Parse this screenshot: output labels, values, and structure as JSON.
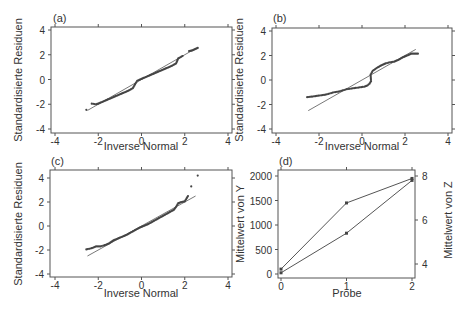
{
  "chart_data": [
    {
      "type": "scatter",
      "panel_label": "(a)",
      "xlabel": "Inverse Normal",
      "ylabel": "Standardisierte Residuen",
      "xlim": [
        -4,
        4
      ],
      "ylim": [
        -4,
        4
      ],
      "xticks": [
        -4,
        -2,
        0,
        2,
        4
      ],
      "yticks": [
        -4,
        -2,
        0,
        2,
        4
      ],
      "grid": false,
      "reference_line": {
        "x": [
          -2.5,
          2.5
        ],
        "y": [
          -2.5,
          2.5
        ]
      },
      "series": [
        {
          "name": "Residuen",
          "points": [
            [
              -2.55,
              -2.45
            ],
            [
              -2.3,
              -1.95
            ],
            [
              -2.1,
              -2.0
            ],
            [
              -2.0,
              -1.95
            ],
            [
              -1.8,
              -1.8
            ],
            [
              -1.6,
              -1.65
            ],
            [
              -1.4,
              -1.5
            ],
            [
              -1.2,
              -1.35
            ],
            [
              -1.0,
              -1.2
            ],
            [
              -0.8,
              -1.05
            ],
            [
              -0.6,
              -0.9
            ],
            [
              -0.4,
              -0.7
            ],
            [
              -0.3,
              -0.4
            ],
            [
              -0.2,
              -0.1
            ],
            [
              0.0,
              0.05
            ],
            [
              0.2,
              0.2
            ],
            [
              0.4,
              0.35
            ],
            [
              0.6,
              0.5
            ],
            [
              0.8,
              0.65
            ],
            [
              1.0,
              0.8
            ],
            [
              1.2,
              0.95
            ],
            [
              1.4,
              1.1
            ],
            [
              1.6,
              1.3
            ],
            [
              1.7,
              1.7
            ],
            [
              1.9,
              1.9
            ],
            [
              2.2,
              2.3
            ],
            [
              2.35,
              2.35
            ],
            [
              2.6,
              2.55
            ]
          ]
        }
      ]
    },
    {
      "type": "scatter",
      "panel_label": "(b)",
      "xlabel": "Inverse Normal",
      "ylabel": "Standardisierte Residuen",
      "xlim": [
        -4,
        4
      ],
      "ylim": [
        -4,
        4
      ],
      "xticks": [
        -4,
        -2,
        0,
        2,
        4
      ],
      "yticks": [
        -4,
        -2,
        0,
        2,
        4
      ],
      "grid": false,
      "reference_line": {
        "x": [
          -2.5,
          2.5
        ],
        "y": [
          -2.5,
          2.5
        ]
      },
      "series": [
        {
          "name": "Residuen",
          "points": [
            [
              -2.55,
              -1.4
            ],
            [
              -2.3,
              -1.35
            ],
            [
              -2.1,
              -1.3
            ],
            [
              -1.9,
              -1.25
            ],
            [
              -1.7,
              -1.2
            ],
            [
              -1.5,
              -1.1
            ],
            [
              -1.3,
              -1.0
            ],
            [
              -1.1,
              -0.95
            ],
            [
              -0.9,
              -0.85
            ],
            [
              -0.7,
              -0.75
            ],
            [
              -0.5,
              -0.7
            ],
            [
              -0.3,
              -0.65
            ],
            [
              -0.1,
              -0.6
            ],
            [
              0.1,
              -0.55
            ],
            [
              0.25,
              -0.45
            ],
            [
              0.35,
              -0.3
            ],
            [
              0.42,
              -0.1
            ],
            [
              0.4,
              0.45
            ],
            [
              0.5,
              0.75
            ],
            [
              0.7,
              1.0
            ],
            [
              0.9,
              1.2
            ],
            [
              1.1,
              1.35
            ],
            [
              1.3,
              1.45
            ],
            [
              1.5,
              1.5
            ],
            [
              1.7,
              1.65
            ],
            [
              1.9,
              1.85
            ],
            [
              2.1,
              2.0
            ],
            [
              2.3,
              2.15
            ],
            [
              2.6,
              2.15
            ]
          ]
        }
      ]
    },
    {
      "type": "scatter",
      "panel_label": "(c)",
      "xlabel": "Inverse Normal",
      "ylabel": "Standardisierte Residuen",
      "xlim": [
        -4,
        4
      ],
      "ylim": [
        -4,
        4
      ],
      "xticks": [
        -4,
        -2,
        0,
        2,
        4
      ],
      "yticks": [
        -4,
        -2,
        0,
        2,
        4
      ],
      "grid": false,
      "reference_line": {
        "x": [
          -2.5,
          2.5
        ],
        "y": [
          -2.5,
          2.5
        ]
      },
      "series": [
        {
          "name": "Residuen",
          "points": [
            [
              -2.55,
              -1.95
            ],
            [
              -2.3,
              -1.85
            ],
            [
              -2.1,
              -1.7
            ],
            [
              -1.9,
              -1.7
            ],
            [
              -1.7,
              -1.6
            ],
            [
              -1.5,
              -1.45
            ],
            [
              -1.3,
              -1.2
            ],
            [
              -1.1,
              -1.05
            ],
            [
              -0.9,
              -0.9
            ],
            [
              -0.7,
              -0.75
            ],
            [
              -0.5,
              -0.55
            ],
            [
              -0.3,
              -0.35
            ],
            [
              -0.1,
              -0.15
            ],
            [
              0.1,
              0.0
            ],
            [
              0.3,
              0.15
            ],
            [
              0.5,
              0.35
            ],
            [
              0.7,
              0.55
            ],
            [
              0.9,
              0.75
            ],
            [
              1.1,
              0.95
            ],
            [
              1.3,
              1.15
            ],
            [
              1.5,
              1.35
            ],
            [
              1.6,
              1.6
            ],
            [
              1.7,
              1.9
            ],
            [
              1.85,
              2.0
            ],
            [
              2.0,
              2.05
            ],
            [
              2.15,
              2.5
            ],
            [
              2.3,
              3.3
            ],
            [
              2.6,
              4.2
            ]
          ]
        }
      ]
    },
    {
      "type": "line",
      "panel_label": "(d)",
      "xlabel": "Probe",
      "ylabel": "Mittelwert von Y",
      "ylabel_right": "Mittelwert von Z",
      "x": [
        0,
        1,
        2
      ],
      "xticks": [
        0,
        1,
        2
      ],
      "ylim": [
        0,
        2000
      ],
      "yticks": [
        0,
        500,
        1000,
        1500,
        2000
      ],
      "ylim_right": [
        3.4,
        8
      ],
      "yticks_right": [
        4,
        6,
        8
      ],
      "grid": false,
      "series": [
        {
          "name": "Mittelwert von Y",
          "axis": "left",
          "values": [
            100,
            1450,
            1950
          ]
        },
        {
          "name": "Mittelwert von Z",
          "axis": "right",
          "values": [
            3.6,
            5.4,
            7.8
          ]
        }
      ]
    }
  ],
  "panels": {
    "a": {
      "label": "(a)",
      "xlabel": "Inverse Normal",
      "ylabel": "Standardisierte Residuen"
    },
    "b": {
      "label": "(b)",
      "xlabel": "Inverse Normal",
      "ylabel": "Standardisierte Residuen"
    },
    "c": {
      "label": "(c)",
      "xlabel": "Inverse Normal",
      "ylabel": "Standardisierte Residuen"
    },
    "d": {
      "label": "(d)",
      "xlabel": "Probe",
      "ylabel": "Mittelwert von Y",
      "ylabel_right": "Mittelwert von Z"
    }
  },
  "colors": {
    "axis": "#555555",
    "points": "#444444",
    "line": "#555555",
    "text": "#333333"
  }
}
